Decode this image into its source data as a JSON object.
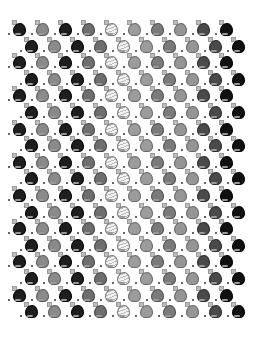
{
  "pattern": {
    "description": "Repeating tiled grid of small sprite icons",
    "rows": 18,
    "columns_per_row": 10,
    "row_spacing_px": 16.6,
    "column_spacing_px": 23,
    "first_row_y": 20,
    "odd_row_x_start": 8,
    "even_row_x_start": 20,
    "icon_variants": [
      {
        "name": "sprite-black",
        "fill": "#1e1e1e",
        "outline": "#000000"
      },
      {
        "name": "sprite-gray",
        "fill": "#8a8a8a",
        "outline": "#5a5a5a"
      },
      {
        "name": "sprite-black",
        "fill": "#1e1e1e",
        "outline": "#000000"
      },
      {
        "name": "sprite-darkgray",
        "fill": "#6e6e6e",
        "outline": "#444444"
      },
      {
        "name": "sprite-outline",
        "fill": "#f2f2f2",
        "outline": "#777777"
      },
      {
        "name": "sprite-lightgray",
        "fill": "#9c9c9c",
        "outline": "#6a6a6a"
      },
      {
        "name": "sprite-midgray",
        "fill": "#7a7a7a",
        "outline": "#505050"
      },
      {
        "name": "sprite-lightgray",
        "fill": "#959595",
        "outline": "#666666"
      },
      {
        "name": "sprite-charcoal",
        "fill": "#4a4a4a",
        "outline": "#2a2a2a"
      },
      {
        "name": "sprite-black",
        "fill": "#111111",
        "outline": "#000000"
      }
    ]
  }
}
